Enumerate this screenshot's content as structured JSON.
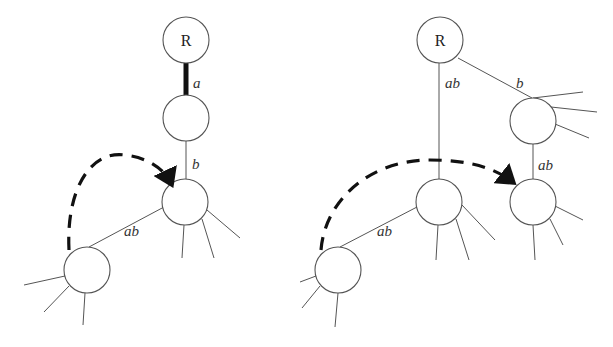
{
  "diagram": {
    "left_tree": {
      "root_label": "R",
      "edges": [
        {
          "from": "R",
          "to": "n1",
          "label": "a",
          "style": "thick"
        },
        {
          "from": "n1",
          "to": "n2",
          "label": "b",
          "style": "thin"
        },
        {
          "from": "n2",
          "to": "n3",
          "label": "ab",
          "style": "thin"
        }
      ],
      "arrow": {
        "from": "n3",
        "to": "n2",
        "style": "dashed"
      }
    },
    "right_tree": {
      "root_label": "R",
      "edges": [
        {
          "from": "R",
          "to": "m1",
          "label": "ab",
          "style": "thin"
        },
        {
          "from": "R",
          "to": "m2",
          "label": "b",
          "style": "thin"
        },
        {
          "from": "m2",
          "to": "m3",
          "label": "ab",
          "style": "thin"
        },
        {
          "from": "m1",
          "to": "m4",
          "label": "ab",
          "style": "thin"
        }
      ],
      "arrow": {
        "from": "m4",
        "to": "m3",
        "style": "dashed"
      }
    },
    "colors": {
      "line": "#555555",
      "thick": "#111111",
      "background": "#ffffff"
    }
  }
}
